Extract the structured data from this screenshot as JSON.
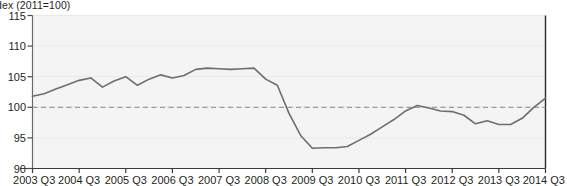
{
  "chart_data": {
    "type": "line",
    "title_visible": "dex (2011=100)",
    "xlabel": "",
    "ylabel": "Index (2011=100)",
    "ylim": [
      90,
      115
    ],
    "yticks": [
      90,
      95,
      100,
      105,
      110,
      115
    ],
    "xticks": [
      "2003 Q3",
      "2004 Q3",
      "2005 Q3",
      "2006 Q3",
      "2007 Q3",
      "2008 Q3",
      "2009 Q3",
      "2010 Q3",
      "2011 Q3",
      "2012 Q3",
      "2013 Q3",
      "2014 Q3"
    ],
    "grid": false,
    "legend": null,
    "reference_line": {
      "value": 100,
      "style": "dashed",
      "color": "#9a9a9a"
    },
    "line_color": "#6e6e6e",
    "annotations": [
      {
        "text": "Source: ONS",
        "x": 0.04,
        "y": 0.08,
        "style": "italic"
      }
    ],
    "x": [
      "2003 Q3",
      "2003 Q4",
      "2004 Q1",
      "2004 Q2",
      "2004 Q3",
      "2004 Q4",
      "2005 Q1",
      "2005 Q2",
      "2005 Q3",
      "2005 Q4",
      "2006 Q1",
      "2006 Q2",
      "2006 Q3",
      "2006 Q4",
      "2007 Q1",
      "2007 Q2",
      "2007 Q3",
      "2007 Q4",
      "2008 Q1",
      "2008 Q2",
      "2008 Q3",
      "2008 Q4",
      "2009 Q1",
      "2009 Q2",
      "2009 Q3",
      "2009 Q4",
      "2010 Q1",
      "2010 Q2",
      "2010 Q3",
      "2010 Q4",
      "2011 Q1",
      "2011 Q2",
      "2011 Q3",
      "2011 Q4",
      "2012 Q1",
      "2012 Q2",
      "2012 Q3",
      "2012 Q4",
      "2013 Q1",
      "2013 Q2",
      "2013 Q3",
      "2013 Q4",
      "2014 Q1",
      "2014 Q2",
      "2014 Q3"
    ],
    "values": [
      101.8,
      102.2,
      103.0,
      103.7,
      104.4,
      104.8,
      103.3,
      104.3,
      105.0,
      103.6,
      104.6,
      105.3,
      104.8,
      105.2,
      106.2,
      106.4,
      106.3,
      106.2,
      106.3,
      106.4,
      104.6,
      103.6,
      99.0,
      95.4,
      93.3,
      93.4,
      93.4,
      93.6,
      94.6,
      95.6,
      96.8,
      98.0,
      99.4,
      100.3,
      99.9,
      99.4,
      99.3,
      98.7,
      97.3,
      97.8,
      97.2,
      97.2,
      98.2,
      100.0,
      101.5
    ]
  },
  "source": {
    "label": "Source: ONS"
  }
}
